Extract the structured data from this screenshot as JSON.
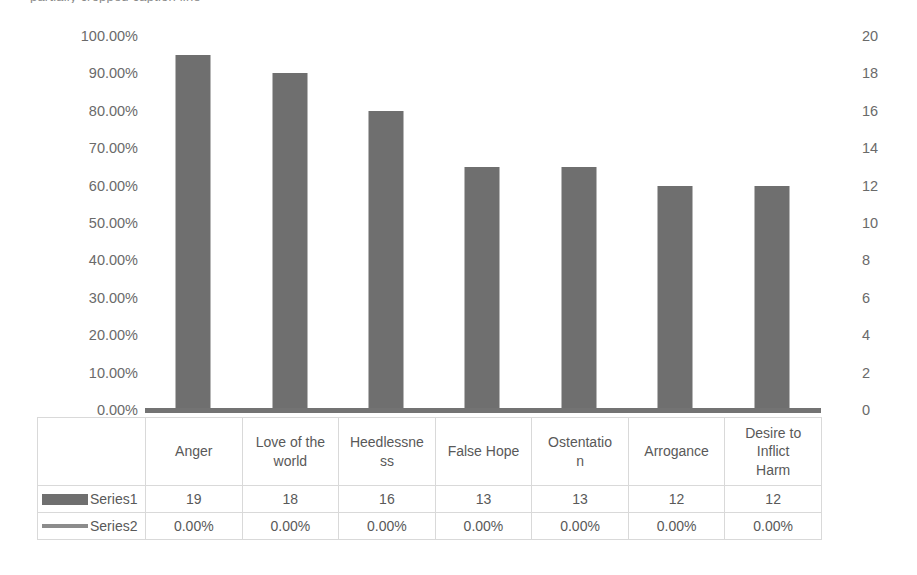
{
  "caption_sliver": "partially cropped caption line",
  "chart_data": {
    "type": "bar",
    "title": "",
    "subtitle": "",
    "xlabel": "",
    "ylabel": "",
    "categories": [
      "Anger",
      "Love of the world",
      "Heedlessness",
      "False Hope",
      "Ostentation",
      "Arrogance",
      "Desire to Inflict Harm"
    ],
    "category_lines": [
      [
        "Anger"
      ],
      [
        "Love of the",
        "world"
      ],
      [
        "Heedlessne",
        "ss"
      ],
      [
        "False Hope"
      ],
      [
        "Ostentatio",
        "n"
      ],
      [
        "Arrogance"
      ],
      [
        "Desire to",
        "Inflict",
        "Harm"
      ]
    ],
    "series": [
      {
        "name": "Series1",
        "axis": "secondary",
        "type": "bar",
        "values": [
          19,
          18,
          16,
          13,
          13,
          12,
          12
        ],
        "display_values": [
          "19",
          "18",
          "16",
          "13",
          "13",
          "12",
          "12"
        ],
        "color": "#6f6f6f"
      },
      {
        "name": "Series2",
        "axis": "primary",
        "type": "line",
        "values": [
          0,
          0,
          0,
          0,
          0,
          0,
          0
        ],
        "display_values": [
          "0.00%",
          "0.00%",
          "0.00%",
          "0.00%",
          "0.00%",
          "0.00%",
          "0.00%"
        ],
        "color": "#8c8c8c"
      }
    ],
    "primary_axis": {
      "label": "",
      "ylim": [
        0,
        1
      ],
      "tick_labels": [
        "100.00%",
        "90.00%",
        "80.00%",
        "70.00%",
        "60.00%",
        "50.00%",
        "40.00%",
        "30.00%",
        "20.00%",
        "10.00%",
        "0.00%"
      ]
    },
    "secondary_axis": {
      "label": "",
      "ylim": [
        0,
        20
      ],
      "tick_labels": [
        "20",
        "18",
        "16",
        "14",
        "12",
        "10",
        "8",
        "6",
        "4",
        "2",
        "0"
      ]
    },
    "grid": false,
    "legend_position": "data-table",
    "data_table_visible": true
  }
}
